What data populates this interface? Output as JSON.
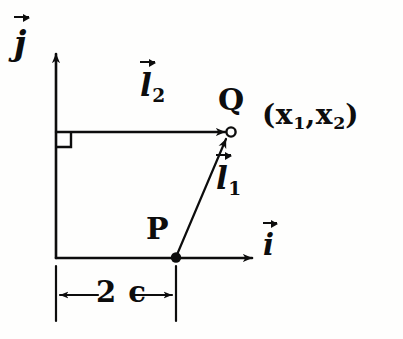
{
  "figure": {
    "kind": "hand-drawn-vector-diagram",
    "background_color": "#fefefd",
    "ink_color": "#0d0d0d",
    "width": 403,
    "height": 339
  },
  "axes": {
    "horizontal": {
      "name": "i-hat axis",
      "label_letter": "i",
      "label_has_vector_arrow": true,
      "origin_px": [
        56,
        258
      ],
      "arrow_tip_px": [
        256,
        258
      ]
    },
    "vertical": {
      "name": "j-hat axis",
      "label_letter": "j",
      "label_has_vector_arrow": true,
      "origin_px": [
        56,
        258
      ],
      "arrow_tip_px": [
        56,
        50
      ]
    }
  },
  "points": {
    "P": {
      "label": "P",
      "marker": "filled-dot",
      "position_px": [
        176,
        258
      ]
    },
    "Q": {
      "label": "Q",
      "marker": "open-circle",
      "position_px": [
        231,
        132
      ],
      "coordinate_label": "(x₁, x₂)",
      "coordinate_parts": {
        "open": "(",
        "x1_base": "x",
        "x1_sub": "1",
        "comma": ",",
        "x2_base": "x",
        "x2_sub": "2",
        "close": ")"
      }
    }
  },
  "vectors": [
    {
      "id": "l1",
      "label_base": "l",
      "label_sub": "1",
      "has_vector_arrow": true,
      "from": "P",
      "to": "Q",
      "from_px": [
        176,
        258
      ],
      "to_px": [
        228,
        136
      ],
      "description": "diagonal vector from P to Q"
    },
    {
      "id": "l2",
      "label_base": "l",
      "label_sub": "2",
      "has_vector_arrow": true,
      "from": "vertical axis",
      "to": "Q",
      "from_px": [
        56,
        132
      ],
      "to_px": [
        228,
        132
      ],
      "description": "horizontal vector from the j-axis to Q"
    }
  ],
  "annotations": {
    "right_angle": {
      "name": "right-angle-marker",
      "at_px": [
        56,
        132
      ],
      "size_px": 15
    },
    "dimension": {
      "name": "dimension-2c",
      "label": "2 c",
      "label_parts": {
        "number": "2",
        "symbol": "c"
      },
      "from_px": [
        56,
        295
      ],
      "to_px": [
        176,
        295
      ],
      "measures": "horizontal distance from the j-axis to point P",
      "extension_line_top_px": 266,
      "extension_line_bottom_px": 320
    }
  },
  "labels": {
    "jhat_letter": "j",
    "ihat_letter": "i",
    "l1_letter": "l",
    "l1_subscript": "1",
    "l2_letter": "l",
    "l2_subscript": "2",
    "point_p": "P",
    "point_q": "Q",
    "dimension_text": "2 c"
  }
}
